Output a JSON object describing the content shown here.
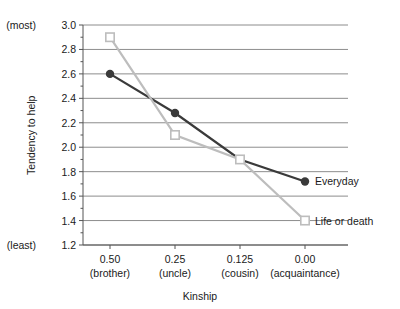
{
  "chart_data": {
    "type": "line",
    "title": "",
    "xlabel": "Kinship",
    "ylabel": "Tendency to help",
    "x": [
      0.5,
      0.25,
      0.125,
      0.0
    ],
    "categories": [
      "0.50",
      "0.25",
      "0.125",
      "0.00"
    ],
    "category_sublabels": [
      "(brother)",
      "(uncle)",
      "(cousin)",
      "(acquaintance)"
    ],
    "xtick_labels": [
      "0.50",
      "0.25",
      "0.125",
      "0.00"
    ],
    "ytick_labels": [
      "3.0",
      "2.8",
      "2.6",
      "2.4",
      "2.2",
      "2.0",
      "1.8",
      "1.6",
      "1.4",
      "1.2"
    ],
    "yticks": [
      3.0,
      2.8,
      2.6,
      2.4,
      2.2,
      2.0,
      1.8,
      1.6,
      1.4,
      1.2
    ],
    "ylim": [
      1.2,
      3.0
    ],
    "y_axis_high_label": "(most)",
    "y_axis_low_label": "(least)",
    "grid": true,
    "grid_axis": "y",
    "legend_position": "inline-right",
    "series": [
      {
        "name": "Everyday",
        "values": [
          2.6,
          2.28,
          1.9,
          1.72
        ],
        "color": "#3a3a3a",
        "marker": "filled-circle",
        "line_width": 2.2
      },
      {
        "name": "Life or death",
        "values": [
          2.9,
          2.1,
          1.9,
          1.4
        ],
        "color": "#bdbdbd",
        "marker": "open-square",
        "line_width": 2.2
      }
    ]
  },
  "axis_style": {
    "gridline_color": "#808080",
    "axis_color": "#555555",
    "tick_color": "#555555"
  }
}
